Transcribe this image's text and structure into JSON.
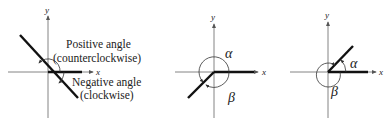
{
  "panels": [
    {
      "id": "panel-1",
      "axis_labels": {
        "x": "x",
        "y": "y"
      },
      "annotations": {
        "positive_line1": "Positive angle",
        "positive_line2": "(counterclockwise)",
        "negative_line1": "Negative angle",
        "negative_line2": "(clockwise)"
      }
    },
    {
      "id": "panel-2",
      "axis_labels": {
        "x": "x",
        "y": "y"
      },
      "angle_labels": {
        "alpha": "α",
        "beta": "β"
      }
    },
    {
      "id": "panel-3",
      "axis_labels": {
        "x": "x",
        "y": "y"
      },
      "angle_labels": {
        "alpha": "α",
        "beta": "β"
      }
    }
  ],
  "colors": {
    "line": "#1a1a1a",
    "axis": "#555555",
    "background": "#ffffff"
  }
}
